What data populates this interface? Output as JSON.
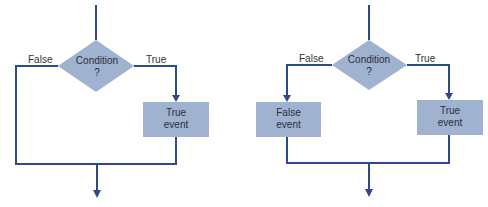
{
  "colors": {
    "line": "#2e4a8c",
    "shape_fill": "#9fb2d0",
    "text": "#2a2f3a"
  },
  "diagrams": [
    {
      "name": "if-then",
      "decision": {
        "line1": "Condition",
        "line2": "?"
      },
      "false_label": "False",
      "true_label": "True",
      "true_box": {
        "line1": "True",
        "line2": "event"
      }
    },
    {
      "name": "if-then-else",
      "decision": {
        "line1": "Condition",
        "line2": "?"
      },
      "false_label": "False",
      "true_label": "True",
      "false_box": {
        "line1": "False",
        "line2": "event"
      },
      "true_box": {
        "line1": "True",
        "line2": "event"
      }
    }
  ]
}
